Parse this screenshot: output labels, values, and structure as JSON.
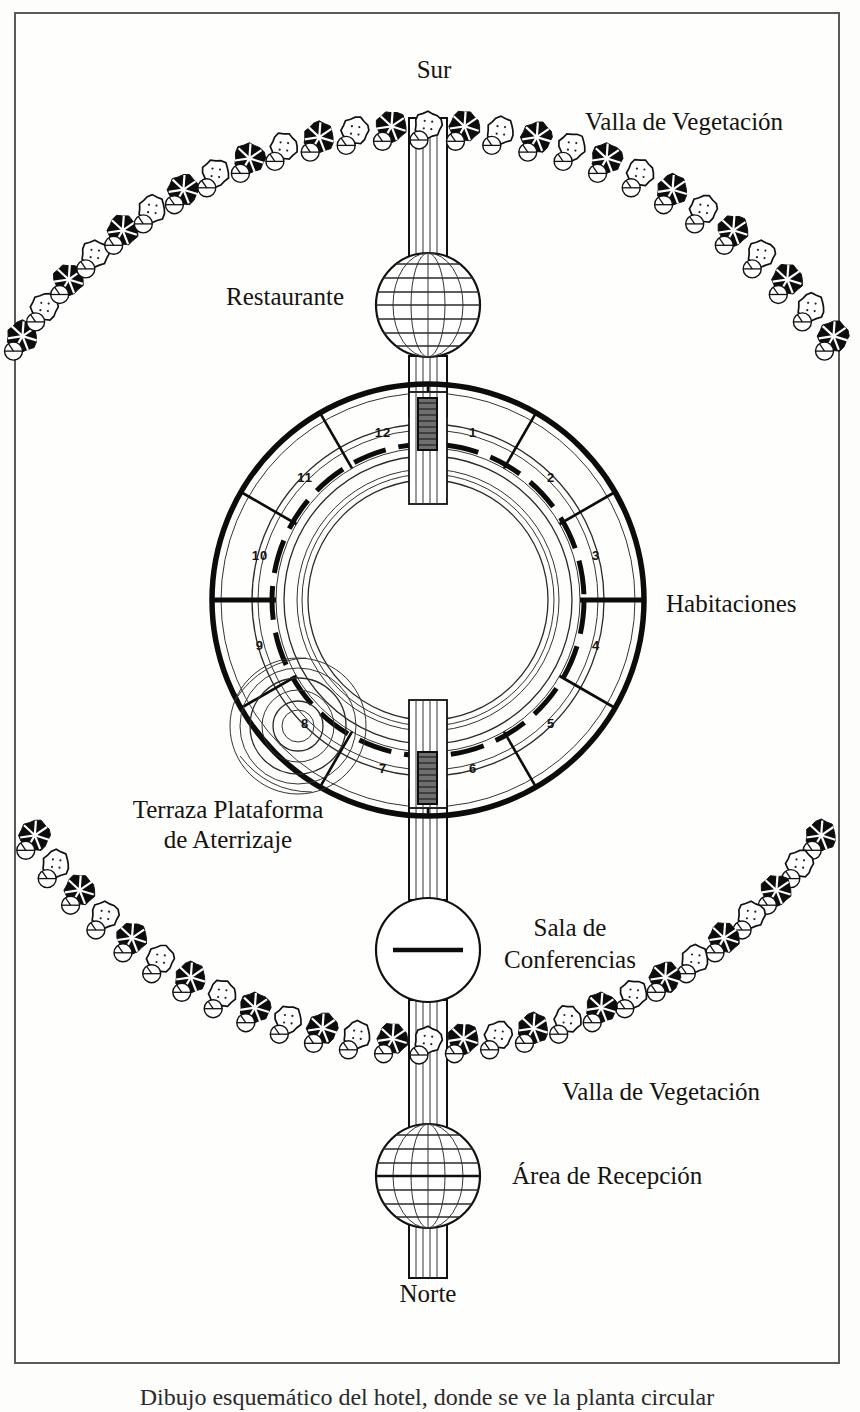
{
  "plate": {
    "title": "Plano esquemático de hotel circular",
    "orientation_top": "Sur",
    "orientation_bottom": "Norte",
    "background_color": "#fdfdfc",
    "ink_color": "#0c0c0c",
    "frame_color": "#5a5a5a"
  },
  "labels": {
    "north": "Norte",
    "south": "Sur",
    "hedge_top": "Valla de Vegetación",
    "hedge_bottom": "Valla de Vegetación",
    "restaurant": "Restaurante",
    "rooms": "Habitaciones",
    "terrace": "Terraza Plataforma",
    "terrace_line2": "de Aterrizaje",
    "conference": "Sala de",
    "conference_line2": "Conferencias",
    "reception": "Área de Recepción"
  },
  "caption": {
    "text": "Dibujo esquemático del hotel, donde se ve la planta circular"
  },
  "rooms": {
    "count": 12,
    "numbers": [
      "1",
      "2",
      "3",
      "4",
      "5",
      "6",
      "7",
      "8",
      "9",
      "10",
      "11",
      "12"
    ],
    "note_room_with_terrace": "8"
  },
  "structures": [
    {
      "name": "restaurant",
      "shape": "globe",
      "label": "Restaurante"
    },
    {
      "name": "room-ring",
      "shape": "annulus",
      "label": "Habitaciones"
    },
    {
      "name": "landing-terrace",
      "shape": "concentric-circles",
      "label": "Terraza Plataforma de Aterrizaje"
    },
    {
      "name": "conference-hall",
      "shape": "circle-with-bar",
      "label": "Sala de Conferencias"
    },
    {
      "name": "reception",
      "shape": "globe",
      "label": "Área de Recepción"
    },
    {
      "name": "hedge-north",
      "shape": "arc-of-trees",
      "label": "Valla de Vegetación"
    },
    {
      "name": "hedge-south",
      "shape": "arc-of-trees",
      "label": "Valla de Vegetación"
    }
  ],
  "geometry": {
    "ring_center_x": 428,
    "ring_center_y": 600,
    "ring_outer_radius": 216,
    "ring_inner_radius": 120,
    "axis_x": 428
  }
}
